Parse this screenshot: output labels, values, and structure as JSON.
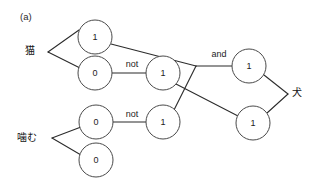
{
  "figure": {
    "panel_label": "(a)",
    "background_color": "#ffffff",
    "stroke_color": "#2b2b2b",
    "node_fill": "#ffffff",
    "node_stroke": "#4a4a4a",
    "text_color": "#1c1c1c",
    "width": 321,
    "height": 192
  },
  "input_terms": [
    {
      "id": "term-neko",
      "label": "猫",
      "x": 30,
      "y": 50
    },
    {
      "id": "term-kamu",
      "label": "噛む",
      "x": 27,
      "y": 137
    }
  ],
  "output_terms": [
    {
      "id": "term-inu",
      "label": "犬",
      "x": 297,
      "y": 92
    }
  ],
  "edge_labels": [
    {
      "id": "label-not-1",
      "text": "not",
      "x": 132,
      "y": 64
    },
    {
      "id": "label-not-2",
      "text": "not",
      "x": 132,
      "y": 114
    },
    {
      "id": "label-and",
      "text": "and",
      "x": 219,
      "y": 54
    }
  ],
  "nodes": [
    {
      "id": "node-neko-upper",
      "value": "1",
      "x": 95,
      "y": 37,
      "r": 17
    },
    {
      "id": "node-neko-lower",
      "value": "0",
      "x": 95,
      "y": 73,
      "r": 17
    },
    {
      "id": "node-not-upper",
      "value": "1",
      "x": 163,
      "y": 73,
      "r": 17
    },
    {
      "id": "node-kamu-upper",
      "value": "0",
      "x": 96,
      "y": 122,
      "r": 17
    },
    {
      "id": "node-kamu-lower",
      "value": "0",
      "x": 96,
      "y": 160,
      "r": 17
    },
    {
      "id": "node-not-lower",
      "value": "1",
      "x": 163,
      "y": 122,
      "r": 17
    },
    {
      "id": "node-and-upper",
      "value": "1",
      "x": 249,
      "y": 66,
      "r": 17
    },
    {
      "id": "node-and-lower",
      "value": "1",
      "x": 253,
      "y": 123,
      "r": 17
    }
  ],
  "branch_points": [
    {
      "id": "branch-neko",
      "x": 48,
      "y": 52
    },
    {
      "id": "branch-kamu",
      "x": 52,
      "y": 138
    },
    {
      "id": "junction-and",
      "x": 196,
      "y": 66
    },
    {
      "id": "junction-inu",
      "x": 288,
      "y": 94
    }
  ],
  "edges": [
    {
      "id": "edge-neko-to-upper",
      "from": "branch-neko",
      "to": "node-neko-upper"
    },
    {
      "id": "edge-neko-to-lower",
      "from": "branch-neko",
      "to": "node-neko-lower"
    },
    {
      "id": "edge-neko-lower-to-not",
      "from": "node-neko-lower",
      "to": "node-not-upper"
    },
    {
      "id": "edge-kamu-to-upper",
      "from": "branch-kamu",
      "to": "node-kamu-upper"
    },
    {
      "id": "edge-kamu-to-lower",
      "from": "branch-kamu",
      "to": "node-kamu-lower"
    },
    {
      "id": "edge-kamu-upper-to-not",
      "from": "node-kamu-upper",
      "to": "node-not-lower"
    },
    {
      "id": "edge-neko-upper-to-junction",
      "from": "node-neko-upper",
      "to": "junction-and"
    },
    {
      "id": "edge-not-upper-to-lower-right",
      "from": "node-not-upper",
      "to": "node-and-lower"
    },
    {
      "id": "edge-not-lower-to-junction",
      "from": "node-not-lower",
      "to": "junction-and"
    },
    {
      "id": "edge-junction-to-and-upper",
      "from": "junction-and",
      "to": "node-and-upper"
    },
    {
      "id": "edge-and-upper-to-inu",
      "from": "node-and-upper",
      "to": "junction-inu"
    },
    {
      "id": "edge-and-lower-to-inu",
      "from": "node-and-lower",
      "to": "junction-inu"
    }
  ]
}
